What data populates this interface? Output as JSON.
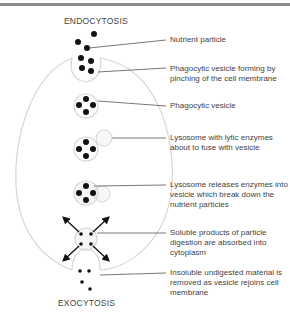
{
  "diagram": {
    "title_top": "ENDOCYTOSIS",
    "title_bottom": "EXOCYTOSIS",
    "labels": [
      {
        "id": "nutrient-particle",
        "text": "Nutrient particle"
      },
      {
        "id": "phagocytic-vesicle-forming",
        "text": "Phagocytic vesicle forming by pinching of the cell membrane"
      },
      {
        "id": "phagocytic-vesicle",
        "text": "Phagocytic vesicle"
      },
      {
        "id": "lysosome-about-to-fuse",
        "text": "Lysosome with lytic enzymes about to fuse with vesicle"
      },
      {
        "id": "lysosome-releases-enzymes",
        "text": "Lysosome releases enzymes into vesicle which break down the nutrient particles"
      },
      {
        "id": "soluble-products",
        "text": "Soluble products of particle digestion are absorbed into cytoplasm"
      },
      {
        "id": "insoluble-material",
        "text": "Insoluble undigested material is removed as vesicle rejoins cell membrane"
      }
    ],
    "colors": {
      "particle": "#111111",
      "membrane": "#d8d8d8",
      "leader_line": "#555555",
      "stipple": "#bdbdbd",
      "top_rule": "#8a8a8a"
    }
  }
}
